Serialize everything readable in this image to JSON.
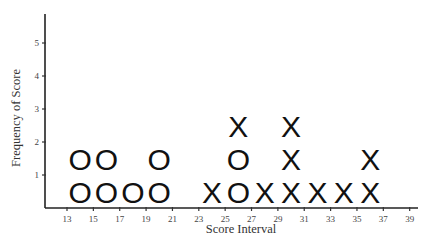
{
  "chart_data": {
    "type": "scatter",
    "subtype": "dot-plot",
    "title": "",
    "xlabel": "Score Interval",
    "ylabel": "Frequency of Score",
    "xlim": [
      11.5,
      40
    ],
    "ylim": [
      0,
      6
    ],
    "x_ticks": [
      13,
      15,
      17,
      19,
      21,
      23,
      25,
      27,
      29,
      31,
      33,
      35,
      37,
      39
    ],
    "y_ticks": [
      1,
      2,
      3,
      4,
      5
    ],
    "grid": false,
    "legend": null,
    "series": [
      {
        "name": "O",
        "marker": "O",
        "points": [
          {
            "x": 14,
            "count": 2
          },
          {
            "x": 16,
            "count": 2
          },
          {
            "x": 18,
            "count": 1
          },
          {
            "x": 20,
            "count": 2
          },
          {
            "x": 26,
            "count": 2
          }
        ]
      },
      {
        "name": "X",
        "marker": "X",
        "points": [
          {
            "x": 24,
            "count": 1
          },
          {
            "x": 26,
            "count": 1,
            "start_level": 3
          },
          {
            "x": 28,
            "count": 1
          },
          {
            "x": 30,
            "count": 3
          },
          {
            "x": 32,
            "count": 1
          },
          {
            "x": 34,
            "count": 1
          },
          {
            "x": 36,
            "count": 2
          }
        ]
      }
    ],
    "stacks": [
      {
        "x": 14,
        "marks": [
          "O",
          "O"
        ]
      },
      {
        "x": 16,
        "marks": [
          "O",
          "O"
        ]
      },
      {
        "x": 18,
        "marks": [
          "O"
        ]
      },
      {
        "x": 20,
        "marks": [
          "O",
          "O"
        ]
      },
      {
        "x": 24,
        "marks": [
          "X"
        ]
      },
      {
        "x": 26,
        "marks": [
          "O",
          "O",
          "X"
        ]
      },
      {
        "x": 28,
        "marks": [
          "X"
        ]
      },
      {
        "x": 30,
        "marks": [
          "X",
          "X",
          "X"
        ]
      },
      {
        "x": 32,
        "marks": [
          "X"
        ]
      },
      {
        "x": 34,
        "marks": [
          "X"
        ]
      },
      {
        "x": 36,
        "marks": [
          "X",
          "X"
        ]
      }
    ]
  },
  "layout": {
    "origin_px": [
      45,
      208
    ],
    "x_axis_end_px": 418,
    "y_axis_top_px": 14,
    "x_ref": {
      "value": 13,
      "px": 67
    },
    "px_per_x_unit": 13.18,
    "px_per_y_unit": 33
  }
}
